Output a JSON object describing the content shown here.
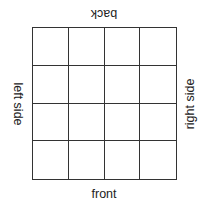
{
  "grid": {
    "rows": 4,
    "cols": 4
  },
  "labels": {
    "back": "back",
    "front": "front",
    "left": "left side",
    "right": "right side"
  }
}
